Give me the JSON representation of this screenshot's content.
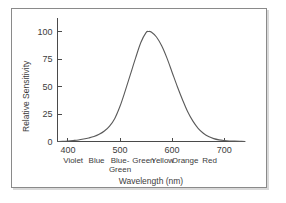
{
  "chart_data": {
    "type": "line",
    "title": "",
    "xlabel": "Wavelength (nm)",
    "ylabel": "Relative Sensitivity",
    "xlim": [
      380,
      740
    ],
    "ylim": [
      0,
      108
    ],
    "grid": false,
    "legend": "none",
    "x_ticks": [
      400,
      500,
      600,
      700
    ],
    "x_tick_labels": [
      "400",
      "500",
      "600",
      "700"
    ],
    "y_ticks": [
      0,
      25,
      50,
      75,
      100
    ],
    "y_tick_labels": [
      "0",
      "25",
      "50",
      "75",
      "100"
    ],
    "series": [
      {
        "name": "Relative Sensitivity",
        "x": [
          380,
          390,
          400,
          410,
          420,
          430,
          440,
          450,
          460,
          470,
          480,
          490,
          500,
          510,
          520,
          530,
          540,
          550,
          555,
          560,
          570,
          580,
          590,
          600,
          610,
          620,
          630,
          640,
          650,
          660,
          670,
          680,
          690,
          700,
          710,
          720,
          730,
          740
        ],
        "values": [
          0,
          0.2,
          0.5,
          0.9,
          1.4,
          2.2,
          3.2,
          4.5,
          6.5,
          9.5,
          14,
          21,
          32,
          46,
          61,
          76,
          90,
          99,
          100,
          99.5,
          95,
          87,
          76,
          63,
          50,
          38,
          27,
          18.5,
          12,
          7.5,
          4.5,
          2.6,
          1.5,
          0.9,
          0.5,
          0.3,
          0.15,
          0.05
        ]
      }
    ],
    "band_labels": [
      {
        "label": "Violet",
        "x": 410
      },
      {
        "label": "Blue",
        "x": 455
      },
      {
        "label": "Blue-",
        "x": 500
      },
      {
        "label": "Green",
        "x": 500,
        "second_line": true
      },
      {
        "label": "Green",
        "x": 545
      },
      {
        "label": "Yellow",
        "x": 582
      },
      {
        "label": "Orange",
        "x": 625
      },
      {
        "label": "Red",
        "x": 672
      }
    ]
  },
  "colors": {
    "curve": "#5a5a5a",
    "axis": "#4a4a4a",
    "text": "#3c3c3c",
    "frame": "#8a8a8a",
    "background": "#ffffff"
  },
  "labels": {
    "y_axis_title": "Relative Sensitivity",
    "x_axis_title": "Wavelength (nm)",
    "band_row_1": [
      "Violet",
      "Blue",
      "Blue-",
      "Green",
      "Yellow",
      "Orange",
      "Red"
    ],
    "band_row_2": [
      "Green"
    ]
  }
}
